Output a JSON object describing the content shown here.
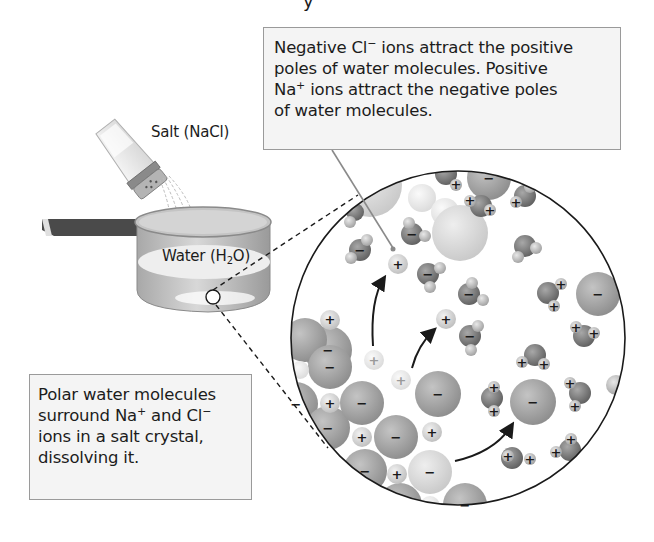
{
  "figure": {
    "title_fragment": "y",
    "labels": {
      "salt": "Salt (NaCl)",
      "water_prefix": "Water (H",
      "water_sub": "2",
      "water_suffix": "O)"
    },
    "callout_top": {
      "lines": [
        {
          "pre": "Negative Cl",
          "sup": "−",
          "post": " ions attract the positive"
        },
        {
          "pre": "poles of water molecules. Positive",
          "sup": "",
          "post": ""
        },
        {
          "pre": "Na",
          "sup": "+",
          "post": " ions attract the negative poles"
        },
        {
          "pre": "of water molecules.",
          "sup": "",
          "post": ""
        }
      ]
    },
    "callout_bottom": {
      "lines": [
        {
          "pre": "Polar water molecules",
          "sup": "",
          "post": ""
        },
        {
          "pre": "surround Na",
          "sup": "+",
          "post": " and Cl"
        },
        {
          "pre": "ions in a salt crystal,",
          "sup": "",
          "post": ""
        },
        {
          "pre": "dissolving it.",
          "sup": "",
          "post": ""
        }
      ],
      "line2_tail_sup": "−"
    },
    "symbols": {
      "positive": "+",
      "negative": "−"
    },
    "colors": {
      "chloride": "#9a9a9a",
      "sodium": "#d6d6d6",
      "water_oxygen": "#8a8a8a",
      "water_hydrogen": "#c8c8c8",
      "callout_bg": "#f4f4f4",
      "callout_border": "#9a9a9a",
      "pot_handle": "#4a4a4a",
      "pot_body": "#bdbdbd"
    },
    "icons": [
      "salt-shaker-icon",
      "pot-icon",
      "chloride-ion-icon",
      "sodium-ion-icon",
      "water-molecule-icon",
      "arrow-icon"
    ]
  }
}
